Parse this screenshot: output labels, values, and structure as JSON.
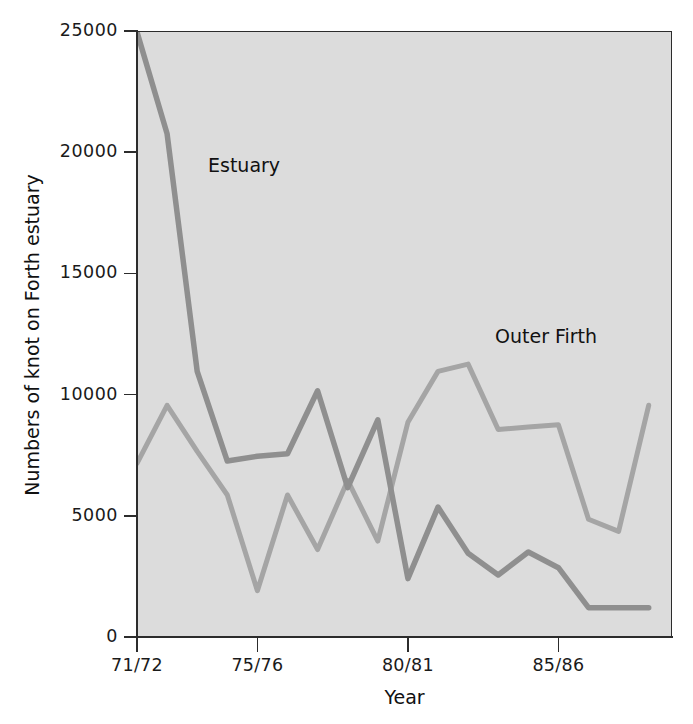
{
  "chart_data": {
    "type": "line",
    "title": "",
    "xlabel": "Year",
    "ylabel": "Numbers of knot on Forth estuary",
    "ylim": [
      0,
      25000
    ],
    "yticks": [
      0,
      5000,
      10000,
      15000,
      20000,
      25000
    ],
    "ytick_labels": [
      "0",
      "5000",
      "10000",
      "15000",
      "20000",
      "25000"
    ],
    "x": [
      "71/72",
      "72/73",
      "73/74",
      "74/75",
      "75/76",
      "76/77",
      "77/78",
      "78/79",
      "79/80",
      "80/81",
      "81/82",
      "82/83",
      "83/84",
      "84/85",
      "85/86",
      "86/87",
      "87/88",
      "88/89"
    ],
    "xticks": [
      "71/72",
      "75/76",
      "80/81",
      "85/86"
    ],
    "xtick_positions": [
      0,
      4,
      9,
      14
    ],
    "grid": false,
    "legend": "inline annotations",
    "series": [
      {
        "name": "Estuary",
        "color": "#8f8f8f",
        "annotation_label": "Estuary",
        "values": [
          25000,
          20800,
          11000,
          7300,
          7500,
          7600,
          10200,
          6200,
          9000,
          2450,
          5400,
          3500,
          2600,
          3550,
          2900,
          1250,
          1250,
          1250
        ],
        "note": "line enters plot clipped at top y-limit of 25000"
      },
      {
        "name": "Outer Firth",
        "color": "#a5a5a5",
        "annotation_label": "Outer Firth",
        "values": [
          7200,
          9600,
          7700,
          5900,
          1950,
          5900,
          3650,
          6500,
          4000,
          8900,
          11000,
          11300,
          8600,
          8700,
          8800,
          4900,
          4400,
          9600
        ]
      }
    ]
  },
  "axes": {
    "x_label": "Year",
    "y_label": "Numbers of knot on Forth estuary"
  },
  "colors": {
    "plot_background": "#dcdcdc",
    "page_background": "#ffffff",
    "axis": "#2c2c2c",
    "text": "#111111",
    "estuary": "#8f8f8f",
    "outer_firth": "#a5a5a5"
  }
}
